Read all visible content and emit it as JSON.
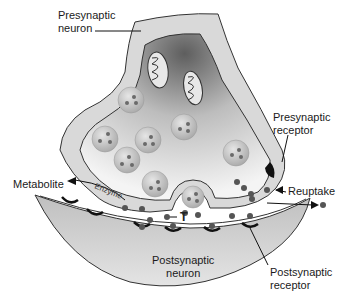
{
  "diagram": {
    "type": "synapse-neurotransmission",
    "labels": {
      "presynaptic_neuron_line1": "Presynaptic",
      "presynaptic_neuron_line2": "neuron",
      "presynaptic_receptor_line1": "Presynaptic",
      "presynaptic_receptor_line2": "receptor",
      "metabolite": "Metabolite",
      "enzyme": "Enzyme",
      "reuptake": "Reuptake",
      "transmitter": "T",
      "postsynaptic_neuron_line1": "Postsynaptic",
      "postsynaptic_neuron_line2": "neuron",
      "postsynaptic_receptor_line1": "Postsynaptic",
      "postsynaptic_receptor_line2": "receptor"
    },
    "colors": {
      "membrane_fill": "#d9d9d9",
      "membrane_stroke": "#333333",
      "cytoplasm_dark": "#6e6e6e",
      "cytoplasm_light": "#f2f2f2",
      "vesicle_fill": "#bdbdbd",
      "transmitter_dot": "#555555",
      "receptor": "#1a1a1a",
      "postsynaptic_fill": "#cfcfcf"
    }
  }
}
